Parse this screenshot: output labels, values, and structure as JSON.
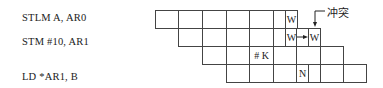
{
  "instructions": [
    {
      "text": "STLM A, AR0",
      "y": 12
    },
    {
      "text": "STM #10, AR1",
      "y": 36
    },
    {
      "text": "LD *AR1, B",
      "y": 71
    }
  ],
  "conflict_label": "冲突",
  "column_edges": [
    155,
    178,
    202,
    226,
    249,
    273,
    285,
    296,
    308,
    320,
    343,
    366
  ],
  "rows": [
    {
      "y": 10,
      "cells": [
        [
          155,
          178,
          ""
        ],
        [
          178,
          202,
          ""
        ],
        [
          202,
          226,
          ""
        ],
        [
          226,
          249,
          ""
        ],
        [
          249,
          273,
          ""
        ],
        [
          273,
          285,
          ""
        ],
        [
          285,
          297,
          "W"
        ]
      ]
    },
    {
      "y": 28,
      "cells": [
        [
          178,
          202,
          ""
        ],
        [
          202,
          226,
          ""
        ],
        [
          226,
          249,
          ""
        ],
        [
          249,
          273,
          ""
        ],
        [
          273,
          285,
          ""
        ],
        [
          285,
          297,
          "W"
        ],
        [
          296,
          308,
          ""
        ],
        [
          308,
          320,
          "W"
        ]
      ]
    },
    {
      "y": 46,
      "cells": [
        [
          202,
          226,
          ""
        ],
        [
          226,
          249,
          ""
        ],
        [
          249,
          273,
          "# K"
        ],
        [
          273,
          296,
          ""
        ],
        [
          296,
          320,
          ""
        ],
        [
          320,
          343,
          ""
        ]
      ]
    },
    {
      "y": 64,
      "cells": [
        [
          226,
          249,
          ""
        ],
        [
          249,
          273,
          ""
        ],
        [
          273,
          296,
          ""
        ],
        [
          296,
          308,
          "N"
        ],
        [
          308,
          320,
          ""
        ],
        [
          320,
          343,
          ""
        ],
        [
          343,
          366,
          ""
        ]
      ]
    }
  ]
}
